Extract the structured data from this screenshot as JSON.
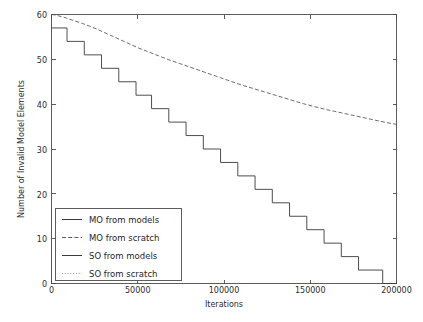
{
  "chart_data": {
    "type": "line",
    "title": "",
    "xlabel": "Iterations",
    "ylabel": "Number of Invalid Model Elements",
    "xlim": [
      0,
      200000
    ],
    "ylim": [
      0,
      60
    ],
    "xticks": [
      0,
      50000,
      100000,
      150000,
      200000
    ],
    "xticklabels": [
      "0",
      "50000",
      "100000",
      "150000",
      "200000"
    ],
    "yticks": [
      0,
      10,
      20,
      30,
      40,
      50,
      60
    ],
    "yticklabels": [
      "0",
      "10",
      "20",
      "30",
      "40",
      "50",
      "60"
    ],
    "grid": false,
    "legend_position": "lower left",
    "background_color": "#ffffff",
    "axis_color": "#4a4a4a",
    "series": [
      {
        "name": "MO from models",
        "label": "MO from models",
        "color": "#3a3a3a",
        "linestyle": "solid",
        "linewidth": 0.9,
        "visible_in_plot": false,
        "x": [],
        "y": []
      },
      {
        "name": "MO from scratch",
        "label": "MO from scratch",
        "color": "#5a5a5a",
        "linestyle": "dashed",
        "linewidth": 0.9,
        "visible_in_plot": true,
        "comment": "upper slowly-declining curve",
        "x": [
          0,
          2000,
          4000,
          6000,
          8000,
          10000,
          14000,
          18000,
          22000,
          26000,
          30000,
          34000,
          38000,
          42000,
          46000,
          50000,
          56000,
          62000,
          68000,
          74000,
          80000,
          86000,
          92000,
          98000,
          104000,
          110000,
          116000,
          122000,
          128000,
          134000,
          140000,
          146000,
          152000,
          158000,
          164000,
          170000,
          176000,
          182000,
          188000,
          194000,
          200000
        ],
        "y": [
          60.0,
          59.9,
          59.7,
          59.5,
          59.3,
          59.0,
          58.5,
          58.0,
          57.4,
          56.8,
          56.1,
          55.4,
          54.7,
          54.0,
          53.3,
          52.6,
          51.7,
          50.8,
          49.9,
          49.1,
          48.3,
          47.5,
          46.7,
          45.9,
          45.1,
          44.3,
          43.6,
          42.9,
          42.2,
          41.5,
          40.8,
          40.1,
          39.5,
          38.9,
          38.4,
          37.9,
          37.4,
          36.9,
          36.4,
          35.9,
          35.5
        ]
      },
      {
        "name": "SO from models",
        "label": "SO from models",
        "color": "#3a3a3a",
        "linestyle": "solid",
        "linewidth": 0.9,
        "visible_in_plot": true,
        "comment": "lower staircase curve descending to zero",
        "step_x": [
          0,
          9000,
          19000,
          29000,
          39000,
          49000,
          58000,
          68000,
          78000,
          88000,
          98000,
          108000,
          118000,
          128000,
          138000,
          148000,
          158000,
          168000,
          178000,
          192000,
          200000
        ],
        "step_y": [
          57,
          54,
          51,
          48,
          45,
          42,
          39,
          36,
          33,
          30,
          27,
          24,
          21,
          18,
          15,
          12,
          9,
          6,
          3,
          0,
          0
        ]
      },
      {
        "name": "SO from scratch",
        "label": "SO from scratch",
        "color": "#8a8a8a",
        "linestyle": "dotted",
        "linewidth": 0.9,
        "visible_in_plot": false,
        "x": [],
        "y": []
      }
    ]
  },
  "legend": {
    "items": [
      {
        "label": "MO from models"
      },
      {
        "label": "MO from scratch"
      },
      {
        "label": "SO from models"
      },
      {
        "label": "SO from scratch"
      }
    ]
  },
  "axes": {
    "x_title": "Iterations",
    "y_title": "Number of Invalid Model Elements",
    "x_tick_0": "0",
    "x_tick_1": "50000",
    "x_tick_2": "100000",
    "x_tick_3": "150000",
    "x_tick_4": "200000",
    "y_tick_0": "0",
    "y_tick_1": "10",
    "y_tick_2": "20",
    "y_tick_3": "30",
    "y_tick_4": "40",
    "y_tick_5": "50",
    "y_tick_6": "60"
  }
}
